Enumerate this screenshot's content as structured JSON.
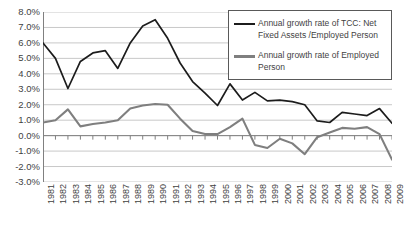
{
  "chart_data": {
    "type": "line",
    "title": "",
    "subtitle": "",
    "xlabel": "",
    "ylabel": "",
    "grid": true,
    "legend_position": "top-right",
    "ylim": [
      -3.0,
      8.0
    ],
    "ytick_step": 1.0,
    "y_tick_labels": [
      "8.0%",
      "7.0%",
      "6.0%",
      "5.0%",
      "4.0%",
      "3.0%",
      "2.0%",
      "1.0%",
      "0.0%",
      "-1.0%",
      "-2.0%",
      "-3.0%"
    ],
    "y_tick_values": [
      8.0,
      7.0,
      6.0,
      5.0,
      4.0,
      3.0,
      2.0,
      1.0,
      0.0,
      -1.0,
      -2.0,
      -3.0
    ],
    "categories": [
      "1981",
      "1982",
      "1983",
      "1984",
      "1985",
      "1986",
      "1987",
      "1988",
      "1989",
      "1990",
      "1991",
      "1992",
      "1993",
      "1994",
      "1995",
      "1996",
      "1997",
      "1998",
      "1999",
      "2000",
      "2001",
      "2002",
      "2003",
      "2004",
      "2005",
      "2006",
      "2007",
      "2008",
      "2009"
    ],
    "units": "percent",
    "series": [
      {
        "name": "Annual growth rate of TCC: Net Fixed Assets /Employed Person",
        "color": "#1c1c1c",
        "values": [
          6.0,
          5.0,
          3.05,
          4.8,
          5.35,
          5.5,
          4.35,
          6.0,
          7.1,
          7.5,
          6.3,
          4.7,
          3.5,
          2.75,
          1.95,
          3.35,
          2.3,
          2.8,
          2.25,
          2.3,
          2.2,
          2.0,
          0.95,
          0.85,
          1.5,
          1.4,
          1.3,
          1.75,
          0.8
        ]
      },
      {
        "name": "Annual growth rate of Employed Person",
        "color": "#7f7f7f",
        "values": [
          0.85,
          1.0,
          1.7,
          0.6,
          0.75,
          0.85,
          1.0,
          1.75,
          1.95,
          2.05,
          2.0,
          1.1,
          0.3,
          0.1,
          0.1,
          0.55,
          1.1,
          -0.6,
          -0.8,
          -0.2,
          -0.5,
          -1.2,
          -0.1,
          0.2,
          0.5,
          0.45,
          0.55,
          0.1,
          -1.55
        ]
      }
    ]
  },
  "legend": {
    "entries": [
      {
        "label": "Annual growth rate of TCC: Net Fixed Assets /Employed Person",
        "color": "#1c1c1c"
      },
      {
        "label": "Annual growth rate of Employed Person",
        "color": "#7f7f7f"
      }
    ]
  },
  "colors": {
    "series_black": "#1c1c1c",
    "series_gray": "#7f7f7f",
    "gridline": "#c8c8c8",
    "axis": "#808080",
    "legend_border": "#595959",
    "background": "#ffffff",
    "text": "#3f3f3f"
  }
}
